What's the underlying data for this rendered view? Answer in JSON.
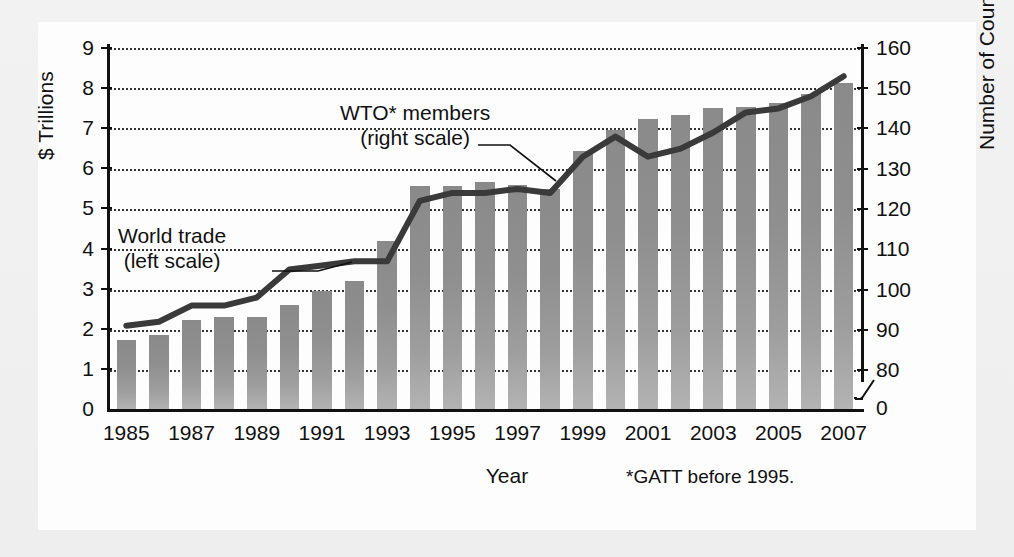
{
  "chart_data": {
    "type": "bar",
    "title": "",
    "xlabel": "Year",
    "ylabel": "$ Trillions",
    "ylabel_right": "Number of Countries",
    "categories": [
      1985,
      1986,
      1987,
      1988,
      1989,
      1990,
      1991,
      1992,
      1993,
      1994,
      1995,
      1996,
      1997,
      1998,
      1999,
      2000,
      2001,
      2002,
      2003,
      2004,
      2005,
      2006,
      2007
    ],
    "xtick_labels": [
      "1985",
      "1987",
      "1989",
      "1991",
      "1993",
      "1995",
      "1997",
      "1999",
      "2001",
      "2003",
      "2005",
      "2007"
    ],
    "ylim": [
      0,
      9
    ],
    "yticks": [
      "0",
      "1",
      "2",
      "3",
      "4",
      "5",
      "6",
      "7",
      "8",
      "9"
    ],
    "ylim_right": [
      70,
      160
    ],
    "yticks_right": [
      "0",
      "80",
      "90",
      "100",
      "110",
      "120",
      "130",
      "140",
      "150",
      "160"
    ],
    "right_axis_break": true,
    "grid": "dotted horizontal",
    "legend_position": "inline annotations",
    "series": [
      {
        "name": "World trade (left scale)",
        "render": "bar",
        "scale": "left",
        "unit": "$ Trillions",
        "values": [
          1.73,
          1.85,
          2.22,
          2.3,
          2.3,
          2.6,
          2.95,
          3.2,
          4.18,
          5.55,
          5.55,
          5.65,
          5.58,
          5.48,
          6.43,
          6.95,
          7.22,
          7.32,
          7.5,
          7.53,
          7.62,
          7.85,
          8.12
        ]
      },
      {
        "name": "WTO* members (right scale)",
        "render": "line",
        "scale": "right",
        "unit": "Number of Countries",
        "values": [
          91,
          92,
          96,
          96,
          98,
          105,
          106,
          107,
          107,
          122,
          124,
          124,
          125,
          124,
          133,
          138,
          133,
          135,
          139,
          144,
          145,
          148,
          153
        ]
      }
    ],
    "annotations": [
      {
        "id": "wto",
        "line1": "WTO* members",
        "line2": "(right scale)"
      },
      {
        "id": "trade",
        "line1": "World trade",
        "line2": "(left scale)"
      }
    ],
    "footnote": "*GATT before 1995.",
    "colors": {
      "bar": "#929292",
      "line": "#3a3a3a",
      "axis": "#111111",
      "grid": "#2b2b2b",
      "panel": "#fdfdfd",
      "page": "#efefef"
    }
  }
}
